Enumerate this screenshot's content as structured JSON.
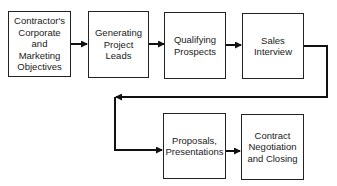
{
  "diagram": {
    "type": "flowchart",
    "nodes": [
      {
        "id": "objectives",
        "label": "Contractor's\nCorporate\nand\nMarketing\nObjectives"
      },
      {
        "id": "leads",
        "label": "Generating\nProject\nLeads"
      },
      {
        "id": "qualifying",
        "label": "Qualifying\nProspects"
      },
      {
        "id": "interview",
        "label": "Sales\nInterview"
      },
      {
        "id": "proposals",
        "label": "Proposals,\nPresentations"
      },
      {
        "id": "contract",
        "label": "Contract\nNegotiation\nand Closing"
      }
    ],
    "edges": [
      {
        "from": "objectives",
        "to": "leads"
      },
      {
        "from": "leads",
        "to": "qualifying"
      },
      {
        "from": "qualifying",
        "to": "interview"
      },
      {
        "from": "interview",
        "to": "proposals"
      },
      {
        "from": "proposals",
        "to": "contract"
      }
    ]
  }
}
